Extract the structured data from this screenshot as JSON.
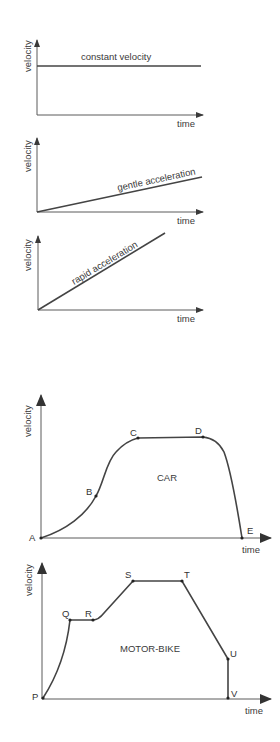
{
  "diagrams": {
    "constant": {
      "ylabel": "velocity",
      "xlabel": "time",
      "line_label": "constant velocity"
    },
    "gentle": {
      "ylabel": "velocity",
      "xlabel": "time",
      "line_label": "gentle acceleration"
    },
    "rapid": {
      "ylabel": "velocity",
      "xlabel": "time",
      "line_label": "rapid acceleration"
    },
    "car": {
      "ylabel": "velocity",
      "xlabel": "time",
      "title": "CAR",
      "points": [
        "A",
        "B",
        "C",
        "D",
        "E"
      ]
    },
    "motorbike": {
      "ylabel": "velocity",
      "xlabel": "time",
      "title": "MOTOR-BIKE",
      "points": [
        "P",
        "Q",
        "R",
        "S",
        "T",
        "U",
        "V"
      ]
    }
  },
  "colors": {
    "line": "#444444",
    "axis": "#5a5a5a",
    "text": "#3a3a3a",
    "background": "#ffffff"
  }
}
